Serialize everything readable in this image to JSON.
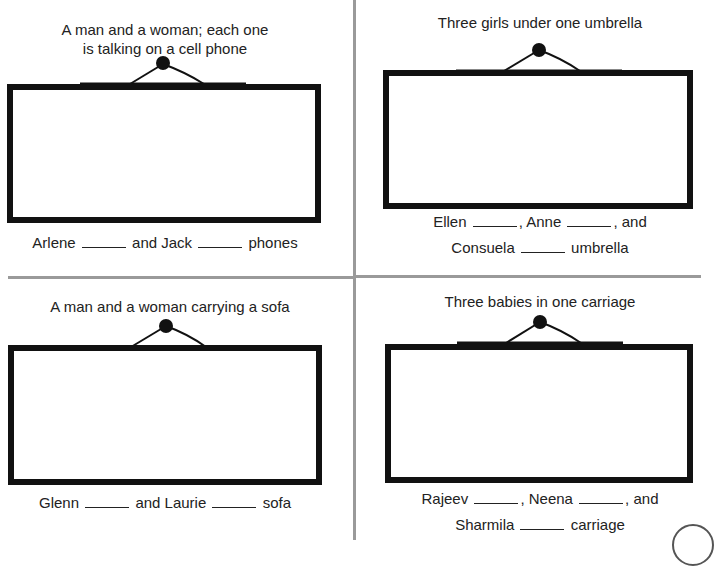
{
  "panels": [
    {
      "caption_line1": "A man and a woman; each one",
      "caption_line2": "is talking on a cell phone",
      "sentence": {
        "line1": {
          "name1": "Arlene",
          "mid": "and Jack",
          "end": "phones"
        }
      }
    },
    {
      "caption_line1": "Three girls under one umbrella",
      "sentence": {
        "line1": {
          "name1": "Ellen",
          "name2": ", Anne",
          "end": ", and"
        },
        "line2": {
          "name3": "Consuela",
          "end": "umbrella"
        }
      }
    },
    {
      "caption_line1": "A man and a woman carrying a sofa",
      "sentence": {
        "line1": {
          "name1": "Glenn",
          "mid": "and Laurie",
          "end": "sofa"
        }
      }
    },
    {
      "caption_line1": "Three babies in one carriage",
      "sentence": {
        "line1": {
          "name1": "Rajeev",
          "name2": ", Neena",
          "end": ", and"
        },
        "line2": {
          "name3": "Sharmila",
          "end": "carriage"
        }
      }
    }
  ],
  "colors": {
    "frame": "#111111",
    "divider": "#9a9a9a",
    "text": "#222222"
  }
}
